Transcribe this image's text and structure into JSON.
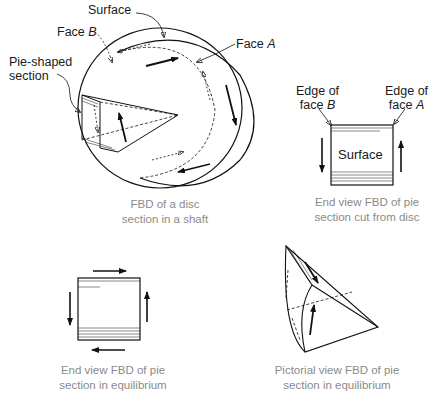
{
  "figure": {
    "panels": [
      {
        "id": "disc",
        "labels": {
          "surface": "Surface",
          "face_b_prefix": "Face ",
          "face_b_letter": "B",
          "face_a_prefix": "Face ",
          "face_a_letter": "A",
          "pie_line1": "Pie-shaped",
          "pie_line2": "section"
        },
        "caption_line1": "FBD of a disc",
        "caption_line2": "section in a shaft"
      },
      {
        "id": "end-view-cut",
        "labels": {
          "edge_b_line1": "Edge of",
          "edge_b_line2_prefix": "face ",
          "edge_b_letter": "B",
          "edge_a_line1": "Edge of",
          "edge_a_line2_prefix": "face ",
          "edge_a_letter": "A",
          "surface": "Surface"
        },
        "caption_line1": "End view FBD of pie",
        "caption_line2": "section cut from disc"
      },
      {
        "id": "end-view-equilibrium",
        "caption_line1": "End view FBD of pie",
        "caption_line2": "section in equilibrium"
      },
      {
        "id": "pictorial-view",
        "caption_line1": "Pictorial view FBD of pie",
        "caption_line2": "section in equilibrium"
      }
    ]
  }
}
